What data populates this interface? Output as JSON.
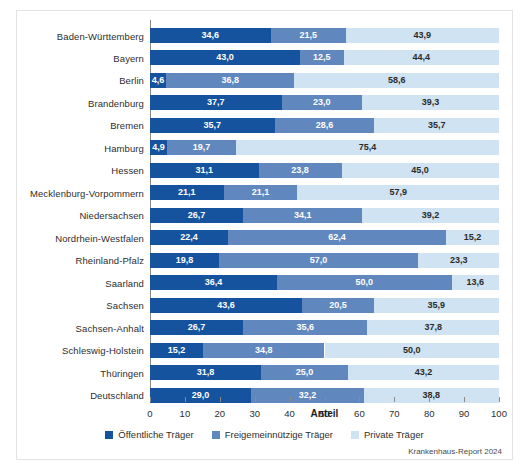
{
  "chart_data": {
    "type": "bar",
    "orientation": "horizontal",
    "stacked": true,
    "title": "",
    "xlabel": "Anteil",
    "ylabel": "",
    "xlim": [
      0,
      100
    ],
    "xticks": [
      "0",
      "10",
      "20",
      "30",
      "40",
      "50",
      "60",
      "70",
      "80",
      "90",
      "100"
    ],
    "grid": false,
    "legend_position": "bottom",
    "categories": [
      "Baden-Württemberg",
      "Bayern",
      "Berlin",
      "Brandenburg",
      "Bremen",
      "Hamburg",
      "Hessen",
      "Mecklenburg-Vorpommern",
      "Niedersachsen",
      "Nordrhein-Westfalen",
      "Rheinland-Pfalz",
      "Saarland",
      "Sachsen",
      "Sachsen-Anhalt",
      "Schleswig-Holstein",
      "Thüringen",
      "Deutschland"
    ],
    "series": [
      {
        "name": "Öffentliche Träger",
        "color": "#16539e",
        "values": [
          34.6,
          43.0,
          4.6,
          37.7,
          35.7,
          4.9,
          31.1,
          21.1,
          26.7,
          22.4,
          19.8,
          36.4,
          43.6,
          26.7,
          15.2,
          31.8,
          29.0
        ],
        "labels": [
          "34,6",
          "43,0",
          "4,6",
          "37,7",
          "35,7",
          "4,9",
          "31,1",
          "21,1",
          "26,7",
          "22,4",
          "19,8",
          "36,4",
          "43,6",
          "26,7",
          "15,2",
          "31,8",
          "29,0"
        ]
      },
      {
        "name": "Freigemeinnützige Träger",
        "color": "#6087be",
        "values": [
          21.5,
          12.5,
          36.8,
          23.0,
          28.6,
          19.7,
          23.8,
          21.1,
          34.1,
          62.4,
          57.0,
          50.0,
          20.5,
          35.6,
          34.8,
          25.0,
          32.2
        ],
        "labels": [
          "21,5",
          "12,5",
          "36,8",
          "23,0",
          "28,6",
          "19,7",
          "23,8",
          "21,1",
          "34,1",
          "62,4",
          "57,0",
          "50,0",
          "20,5",
          "35,6",
          "34,8",
          "25,0",
          "32,2"
        ]
      },
      {
        "name": "Private Träger",
        "color": "#cfe3f2",
        "values": [
          43.9,
          44.4,
          58.6,
          39.3,
          35.7,
          75.4,
          45.0,
          57.9,
          39.2,
          15.2,
          23.3,
          13.6,
          35.9,
          37.8,
          50.0,
          43.2,
          38.8
        ],
        "labels": [
          "43,9",
          "44,4",
          "58,6",
          "39,3",
          "35,7",
          "75,4",
          "45,0",
          "57,9",
          "39,2",
          "15,2",
          "23,3",
          "13,6",
          "35,9",
          "37,8",
          "50,0",
          "43,2",
          "38,8"
        ]
      }
    ]
  },
  "source": "Krankenhaus-Report 2024"
}
